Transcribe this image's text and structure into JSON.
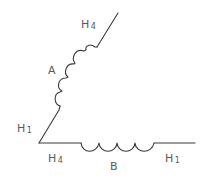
{
  "diagram": {
    "title": "",
    "colors": {
      "stroke": "#3a3a3a",
      "label": "#5a5a5a",
      "background": "#ffffff"
    },
    "windings": [
      {
        "id": "A",
        "label": "A",
        "start_terminal": {
          "letter": "H",
          "index": "1"
        },
        "end_terminal": {
          "letter": "H",
          "index": "4"
        },
        "coil_turns": 4,
        "orientation": "diagonal"
      },
      {
        "id": "B",
        "label": "B",
        "start_terminal": {
          "letter": "H",
          "index": "4"
        },
        "end_terminal": {
          "letter": "H",
          "index": "1"
        },
        "coil_turns": 4,
        "orientation": "horizontal"
      }
    ],
    "labels": {
      "a_top": {
        "letter": "H",
        "index": "4"
      },
      "a_name": "A",
      "a_bottom": {
        "letter": "H",
        "index": "1"
      },
      "b_left": {
        "letter": "H",
        "index": "4"
      },
      "b_name": "B",
      "b_right": {
        "letter": "H",
        "index": "1"
      }
    }
  }
}
